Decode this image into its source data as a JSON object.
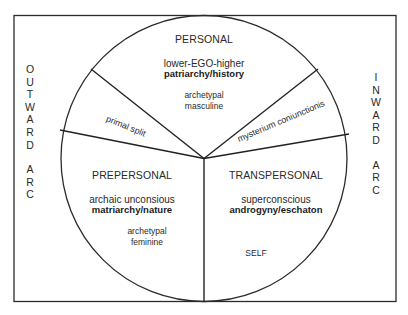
{
  "diagram": {
    "type": "circle-wedge-diagram",
    "frame": {
      "stroke": "#2b2b2b"
    },
    "left_arc": {
      "word1": [
        "O",
        "U",
        "T",
        "W",
        "A",
        "R",
        "D"
      ],
      "word2": [
        "A",
        "R",
        "C"
      ],
      "label": "OUTWARD ARC"
    },
    "right_arc": {
      "word1": [
        "I",
        "N",
        "W",
        "A",
        "R",
        "D"
      ],
      "word2": [
        "A",
        "R",
        "C"
      ],
      "label": "INWARD ARC"
    },
    "sections": {
      "personal": {
        "title": "PERSONAL",
        "line1": "lower-EGO-higher",
        "line2": "patriarchy/history",
        "note1": "archetypal",
        "note2": "masculine"
      },
      "prepersonal": {
        "title": "PREPERSONAL",
        "line1": "archaic unconsious",
        "line2": "matriarchy/nature",
        "note1": "archetypal",
        "note2": "feminine"
      },
      "transpersonal": {
        "title": "TRANSPERSONAL",
        "line1": "superconscious",
        "line2": "androgyny/eschaton",
        "note1": "SELF"
      }
    },
    "wedges": {
      "left": "primal split",
      "right": "mysterium coniunctionis"
    }
  }
}
